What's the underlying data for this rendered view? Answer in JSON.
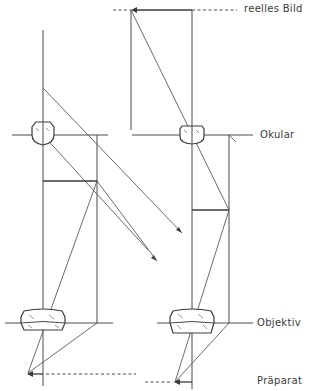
{
  "diagram": {
    "labels": {
      "real_image": "reelles Bild",
      "eyepiece": "Okular",
      "objective": "Objektiv",
      "specimen": "Präparat"
    },
    "panels": [
      {
        "name": "left",
        "description": "Strahlengang mit virtuellem Bild (Strahlen divergieren nach dem Okular)"
      },
      {
        "name": "right",
        "description": "Strahlengang mit reellem Bild über dem Okular"
      }
    ],
    "colors": {
      "line": "#4a4a4a",
      "text": "#3a3a3a",
      "background": "#ffffff"
    }
  }
}
